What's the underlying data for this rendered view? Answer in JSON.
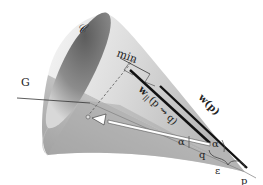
{
  "diagram": {
    "labels": {
      "cone": "𝒞",
      "plane": "G",
      "min": "min",
      "w_p": "w(p)",
      "w_par": "w",
      "w_par_sub": "||",
      "w_par_args": "(p ⇝ q)",
      "alpha_inner": "α",
      "alpha_outer": "α",
      "q": "q",
      "p": "p",
      "epsilon": "ε"
    },
    "colors": {
      "cone_dark": "#6a6a6a",
      "cone_light": "#f2f2f2",
      "line": "#111111",
      "dashed": "#555555"
    }
  }
}
